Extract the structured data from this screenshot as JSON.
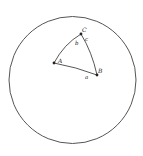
{
  "diagram": {
    "type": "spherical-triangle-on-sphere",
    "sphere": {
      "cx": 72.5,
      "cy": 80,
      "r": 63.5,
      "stroke": "#555555"
    },
    "vertices": [
      {
        "name": "A",
        "label": "A",
        "x": 54,
        "y": 63,
        "label_x": 58,
        "label_y": 63
      },
      {
        "name": "B",
        "label": "B",
        "x": 97,
        "y": 75,
        "label_x": 98,
        "label_y": 73
      },
      {
        "name": "C",
        "label": "C",
        "x": 81,
        "y": 34,
        "label_x": 82,
        "label_y": 32
      }
    ],
    "sides": [
      {
        "name": "a",
        "label": "a",
        "label_x": 85,
        "label_y": 79
      },
      {
        "name": "b",
        "label": "b",
        "label_x": 75,
        "label_y": 45
      },
      {
        "name": "c",
        "label": "c",
        "label_x": 85,
        "label_y": 41
      }
    ],
    "colors": {
      "line": "#444444",
      "text": "#222222",
      "background": "#ffffff"
    }
  }
}
